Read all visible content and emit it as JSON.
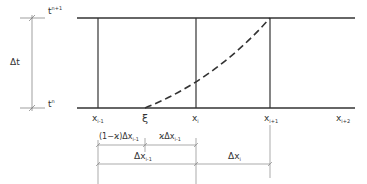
{
  "diagram": {
    "time_labels": {
      "top": "t",
      "top_sup": "n+1",
      "bottom": "t",
      "bottom_sup": "n",
      "delta_t": "Δt"
    },
    "grid_labels": [
      {
        "base": "x",
        "sub": "i-1"
      },
      {
        "base": "ξ",
        "sub": ""
      },
      {
        "base": "x",
        "sub": "i"
      },
      {
        "base": "x",
        "sub": "i+1"
      },
      {
        "base": "x",
        "sub": "i+2"
      }
    ],
    "dimensions": {
      "left_part": "(1−ϰ)Δx",
      "left_part_sub": "i-1",
      "right_part": "ϰΔx",
      "right_part_sub": "i-1",
      "cell_prev": "Δx",
      "cell_prev_sub": "i-1",
      "cell_curr": "Δx",
      "cell_curr_sub": "i"
    },
    "colors": {
      "line": "#222222",
      "text": "#333333"
    }
  }
}
